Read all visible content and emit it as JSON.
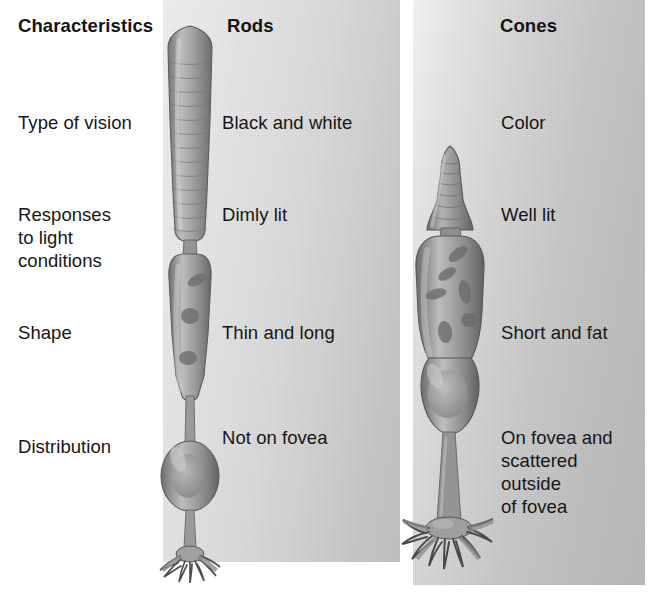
{
  "figure": {
    "colors": {
      "panel_light": "#f2f2f2",
      "panel_dark": "#bcbcbc",
      "cell_gray": "#9b9b9b",
      "cell_dark": "#6e6e6e",
      "cell_highlight": "#c9c9c9",
      "text": "#161616"
    }
  },
  "headers": {
    "characteristics": "Characteristics",
    "rods": "Rods",
    "cones": "Cones"
  },
  "rows": [
    {
      "label": "Type of vision",
      "rods": "Black and white",
      "cones": "Color"
    },
    {
      "label": "Responses\nto light\nconditions",
      "rods": "Dimly lit",
      "cones": "Well lit"
    },
    {
      "label": "Shape",
      "rods": "Thin and long",
      "cones": "Short and fat"
    },
    {
      "label": "Distribution",
      "rods": "Not on fovea",
      "cones": "On fovea and\nscattered\noutside\nof fovea"
    }
  ],
  "illustrations": {
    "rod_cell": "rod-photoreceptor-cell",
    "cone_cell": "cone-photoreceptor-cell"
  }
}
